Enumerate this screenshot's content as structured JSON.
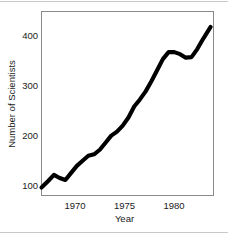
{
  "figure": {
    "background_color": "#ffffff",
    "line_color": "#000000",
    "frame_color": "#8a8a8a",
    "rule_color": "#c9c9c9"
  },
  "axes": {
    "y_title": "Number of Scientists",
    "x_title": "Year",
    "y_ticks": [
      "100",
      "200",
      "300",
      "400"
    ],
    "x_ticks": [
      "1970",
      "1975",
      "1980"
    ]
  },
  "chart_data": {
    "type": "line",
    "title": "",
    "xlabel": "Year",
    "ylabel": "Number of Scientists",
    "xlim": [
      1966.5,
      1984.5
    ],
    "ylim": [
      85,
      430
    ],
    "xticks": [
      1970,
      1975,
      1980
    ],
    "yticks": [
      100,
      200,
      300,
      400
    ],
    "grid": false,
    "legend": null,
    "series": [
      {
        "name": "Number of Scientists",
        "color": "#000000",
        "x": [
          1966.5,
          1967.2,
          1967.8,
          1968.4,
          1969.0,
          1969.6,
          1970.2,
          1970.8,
          1971.4,
          1972.0,
          1972.6,
          1973.2,
          1973.8,
          1974.4,
          1975.0,
          1975.6,
          1976.2,
          1976.8,
          1977.4,
          1978.0,
          1978.6,
          1979.2,
          1979.8,
          1980.4,
          1981.0,
          1981.6,
          1982.2,
          1982.8,
          1983.4,
          1984.2
        ],
        "values": [
          97,
          110,
          122,
          116,
          112,
          126,
          140,
          150,
          160,
          163,
          172,
          186,
          200,
          208,
          220,
          236,
          258,
          272,
          288,
          308,
          330,
          352,
          366,
          366,
          362,
          355,
          356,
          372,
          392,
          416
        ]
      }
    ]
  }
}
